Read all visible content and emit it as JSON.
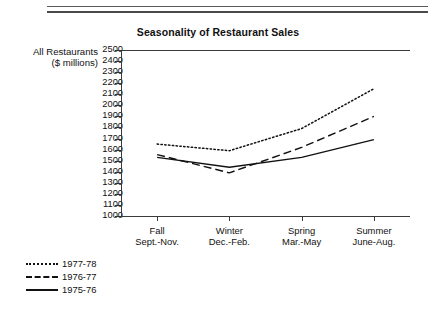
{
  "header": {
    "title": "Seasonality of Restaurant Sales"
  },
  "caption": {
    "line1": "All Restaurants",
    "line2": "($ millions)"
  },
  "legend": {
    "items": [
      {
        "label": "1977-78",
        "style": "dotted",
        "color": "#111111"
      },
      {
        "label": "1976-77",
        "style": "dashed",
        "color": "#111111"
      },
      {
        "label": "1975-76",
        "style": "solid",
        "color": "#111111"
      }
    ]
  },
  "chart_data": {
    "type": "line",
    "title": "Seasonality of Restaurant Sales",
    "xlabel": "",
    "ylabel": "All Restaurants ($ millions)",
    "categories": [
      "Fall\nSept.-Nov.",
      "Winter\nDec.-Feb.",
      "Spring\nMar.-May",
      "Summer\nJune-Aug."
    ],
    "category_lines": [
      [
        "Fall",
        "Sept.-Nov."
      ],
      [
        "Winter",
        "Dec.-Feb."
      ],
      [
        "Spring",
        "Mar.-May"
      ],
      [
        "Summer",
        "June-Aug."
      ]
    ],
    "ylim": [
      1000,
      2500
    ],
    "ytick_step": 100,
    "yticks": [
      2500,
      2400,
      2300,
      2200,
      2100,
      2000,
      1900,
      1800,
      1700,
      1600,
      1500,
      1400,
      1300,
      1200,
      1100,
      1000
    ],
    "grid": false,
    "legend_position": "bottom-left",
    "series": [
      {
        "name": "1977-78",
        "style": "dotted",
        "values": [
          1650,
          1590,
          1790,
          2150
        ]
      },
      {
        "name": "1976-77",
        "style": "dashed",
        "values": [
          1555,
          1390,
          1620,
          1900
        ]
      },
      {
        "name": "1975-76",
        "style": "solid",
        "values": [
          1530,
          1440,
          1530,
          1690
        ]
      }
    ]
  }
}
